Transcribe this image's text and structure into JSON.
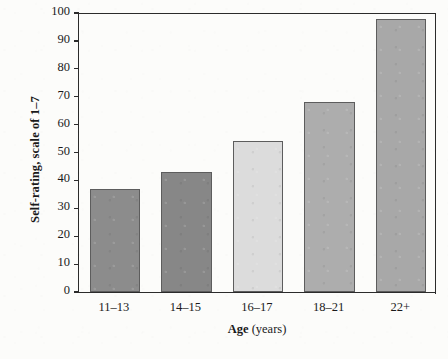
{
  "chart_data": {
    "type": "bar",
    "title": "",
    "subtitle": "",
    "categories": [
      "11–13",
      "14–15",
      "16–17",
      "18–21",
      "22+"
    ],
    "values": [
      37,
      43,
      54,
      68,
      98
    ],
    "series": [
      {
        "name": "Self-rating",
        "values": [
          37,
          43,
          54,
          68,
          98
        ]
      }
    ],
    "xlabel": "Age",
    "xlabel_unit": "(years)",
    "ylabel": "Self-rating, scale of 1–7",
    "ylim": [
      0,
      100
    ],
    "ytick_values": [
      0,
      10,
      20,
      30,
      40,
      50,
      60,
      70,
      80,
      90,
      100
    ],
    "ytick_labels": [
      "0",
      "10",
      "20",
      "30",
      "40",
      "50",
      "60",
      "70",
      "80",
      "90",
      "100"
    ],
    "grid": false,
    "legend": false,
    "legend_position": "none",
    "bar_colors": [
      "#8c8c8c",
      "#878787",
      "#dcdcdc",
      "#adadad",
      "#a8a8a8"
    ],
    "bar_edge_color": "#5d5d5d",
    "axis_color": "#2b2b2b",
    "background_color": "#fcfcfa",
    "text_color": "#1a1a1a"
  }
}
